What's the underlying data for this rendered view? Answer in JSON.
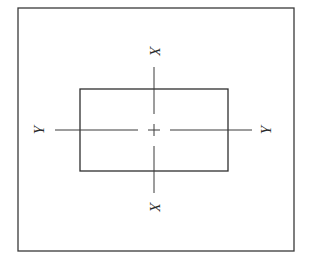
{
  "figure": {
    "line_color": "#3a3a3a",
    "outer_frame": {
      "x": 18,
      "y": 8,
      "width": 276,
      "height": 243
    },
    "section_rect": {
      "x": 80,
      "y": 89,
      "width": 148,
      "height": 82
    },
    "centroid": {
      "x": 154,
      "y": 130
    },
    "axes": {
      "x_axis": {
        "label_top": "X",
        "label_bottom": "X",
        "orientation": "vertical",
        "segments": [
          [
            67,
            114
          ],
          [
            122,
            138
          ],
          [
            146,
            193
          ]
        ]
      },
      "y_axis": {
        "label_left": "Y",
        "label_right": "Y",
        "orientation": "horizontal",
        "segments": [
          [
            55,
            138
          ],
          [
            146,
            162
          ],
          [
            170,
            252
          ]
        ]
      }
    }
  }
}
